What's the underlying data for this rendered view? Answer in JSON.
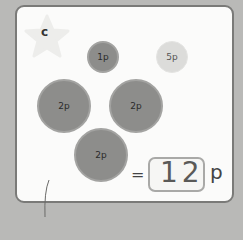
{
  "worksheet": {
    "question_label": "c",
    "coins": [
      {
        "value": "1p",
        "style": "dark",
        "size": "small"
      },
      {
        "value": "5p",
        "style": "light",
        "size": "small"
      },
      {
        "value": "2p",
        "style": "dark",
        "size": "large"
      },
      {
        "value": "2p",
        "style": "dark",
        "size": "large"
      },
      {
        "value": "2p",
        "style": "dark",
        "size": "large"
      }
    ],
    "equals_sign": "=",
    "answer": "12",
    "unit": "p"
  },
  "colors": {
    "card_background": "#fbfbfa",
    "card_border": "#7a7a78",
    "dark_coin": "#8d8d8b",
    "light_coin": "#dcdcda",
    "star": "#ededeb"
  }
}
